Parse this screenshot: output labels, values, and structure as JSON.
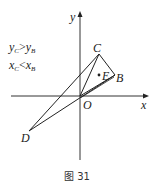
{
  "figure": {
    "caption": "图 31",
    "axes": {
      "x_label": "x",
      "y_label": "y",
      "origin_label": "O"
    },
    "points": {
      "C": {
        "label": "C"
      },
      "B": {
        "label": "B"
      },
      "E": {
        "label": "E"
      },
      "D": {
        "label": "D"
      },
      "O": {
        "label": "O"
      }
    },
    "conditions": {
      "line1": {
        "lhs": "y",
        "lhs_sub": "C",
        "op": ">",
        "rhs": "y",
        "rhs_sub": "B"
      },
      "line2": {
        "lhs": "x",
        "lhs_sub": "C",
        "op": "<",
        "rhs": "x",
        "rhs_sub": "B"
      }
    },
    "colors": {
      "stroke": "#222222",
      "background": "#ffffff"
    }
  }
}
